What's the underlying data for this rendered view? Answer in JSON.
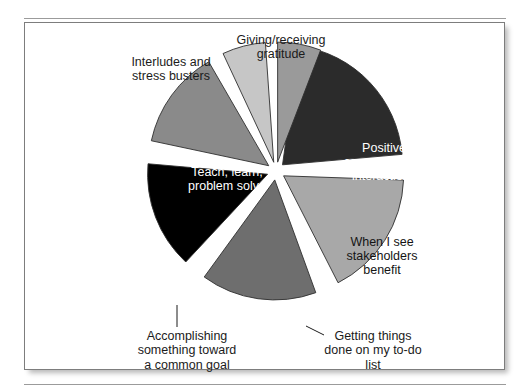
{
  "figure": {
    "background_color": "#ffffff",
    "border_color": "#7d7d7d",
    "rule_color": "#9b9b9b"
  },
  "chart_data": {
    "type": "pie",
    "title": "",
    "subtitle": "",
    "xlabel": "",
    "ylabel": "",
    "legend_position": "none",
    "grid": false,
    "exploded": true,
    "center": [
      275,
      170
    ],
    "radius": 120,
    "categories": [
      "Positive conversations/ interactions",
      "When I  see stakeholders benefit",
      "Getting things done on my to-do list",
      "Accomplishing something toward a common goal",
      "Teach, learn, problem solve",
      "Interludes and stress busters",
      "Giving/receiving gratitude"
    ],
    "values": [
      21.5,
      17.0,
      15.5,
      14.5,
      15.0,
      8.5,
      8.0
    ],
    "colors": [
      "#2b2b2b",
      "#a8a8a8",
      "#6e6e6e",
      "#000000",
      "#8a8a8a",
      "#c6c6c6",
      "#9a9a9a"
    ],
    "slices": [
      {
        "label": "Positive\nconversations/\ninteractions",
        "value": 21.5,
        "color": "#2b2b2b",
        "start_angle": 8,
        "end_angle": 85,
        "label_placement": "inside",
        "label_color": "#ffffff"
      },
      {
        "label": "When I  see\nstakeholders\nbenefit",
        "value": 17.0,
        "color": "#a8a8a8",
        "start_angle": 92,
        "end_angle": 153,
        "label_placement": "inside",
        "label_color": "#141414"
      },
      {
        "label": "Getting things\ndone on my to-do\nlist",
        "value": 15.5,
        "color": "#6e6e6e",
        "start_angle": 160,
        "end_angle": 216,
        "label_placement": "callout",
        "label_color": "#1b1b1b"
      },
      {
        "label": "Accomplishing\nsomething toward\na common goal",
        "value": 14.5,
        "color": "#000000",
        "start_angle": 223,
        "end_angle": 275,
        "label_placement": "callout",
        "label_color": "#1b1b1b"
      },
      {
        "label": "Teach, learn,\nproblem solve",
        "value": 15.0,
        "color": "#8a8a8a",
        "start_angle": 282,
        "end_angle": 330,
        "label_placement": "inside",
        "label_color": "#ffffff"
      },
      {
        "label": "Interludes and\nstress busters",
        "value": 8.5,
        "color": "#c6c6c6",
        "start_angle": 335,
        "end_angle": 356,
        "label_placement": "outside",
        "label_color": "#1b1b1b"
      },
      {
        "label": "Giving/receiving\ngratitude",
        "value": 8.0,
        "color": "#9a9a9a",
        "start_angle": 360,
        "end_angle": 381,
        "label_placement": "outside",
        "label_color": "#1b1b1b"
      }
    ]
  }
}
